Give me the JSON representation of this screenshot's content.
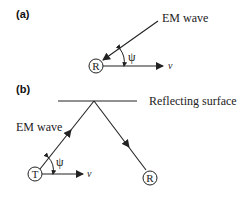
{
  "panel_a": {
    "label": "(a)",
    "wave_label": "EM wave",
    "receiver": "R",
    "angle": "ψ",
    "velocity": "v"
  },
  "panel_b": {
    "label": "(b)",
    "surface_label": "Reflecting surface",
    "wave_label": "EM wave",
    "transmitter": "T",
    "receiver": "R",
    "angle": "ψ",
    "velocity": "v"
  },
  "colors": {
    "line": "#222222",
    "background": "#ffffff"
  }
}
